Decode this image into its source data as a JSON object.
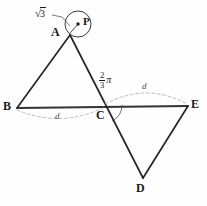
{
  "figure": {
    "type": "geometry-diagram",
    "background_color": "#fefefe",
    "stroke_color": "#262626",
    "guide_color": "#b0b0b0",
    "vertices": [
      {
        "id": "A",
        "label": "A",
        "x": 70,
        "y": 35,
        "label_x": 53,
        "label_y": 27
      },
      {
        "id": "B",
        "label": "B",
        "x": 17,
        "y": 108,
        "label_x": 4,
        "label_y": 101
      },
      {
        "id": "C",
        "label": "C",
        "x": 104,
        "y": 105,
        "label_x": 97,
        "label_y": 110
      },
      {
        "id": "D",
        "label": "D",
        "x": 143,
        "y": 178,
        "label_x": 137,
        "label_y": 183
      },
      {
        "id": "E",
        "label": "E",
        "x": 188,
        "y": 106,
        "label_x": 192,
        "label_y": 99
      },
      {
        "id": "P",
        "label": "P",
        "x": 78,
        "y": 24,
        "label_x": 84,
        "label_y": 17
      }
    ],
    "circle": {
      "center_x": 78,
      "center_y": 24,
      "radius": 13,
      "center_dot_radius": 1.6
    },
    "radius_measure": {
      "value": "3",
      "symbol": "√",
      "label_x": 36,
      "label_y": 9,
      "leader_from_x": 53,
      "leader_from_y": 15,
      "leader_to_x": 70,
      "leader_to_y": 26
    },
    "angle_measure": {
      "numerator": "2",
      "denominator": "3",
      "symbol": "π",
      "label_x": 104,
      "label_y": 76,
      "arc_radius": 15,
      "at_vertex": "C"
    },
    "arcs": [
      {
        "id": "arc-bc",
        "label": "d",
        "from_x": 17,
        "from_y": 109,
        "to_x": 104,
        "to_y": 107,
        "ctrl_x": 60,
        "ctrl_y": 127,
        "label_x": 56,
        "label_y": 113,
        "direction": "below"
      },
      {
        "id": "arc-ce",
        "label": "d",
        "from_x": 104,
        "from_y": 104,
        "to_x": 188,
        "to_y": 105,
        "ctrl_x": 146,
        "ctrl_y": 83,
        "label_x": 143,
        "label_y": 84,
        "direction": "above"
      }
    ],
    "segments": [
      {
        "id": "AB",
        "from": "A",
        "to": "B"
      },
      {
        "id": "BE",
        "from": "B",
        "to": "E"
      },
      {
        "id": "AD",
        "from": "A",
        "to": "D"
      },
      {
        "id": "DE",
        "from": "D",
        "to": "E"
      }
    ]
  }
}
